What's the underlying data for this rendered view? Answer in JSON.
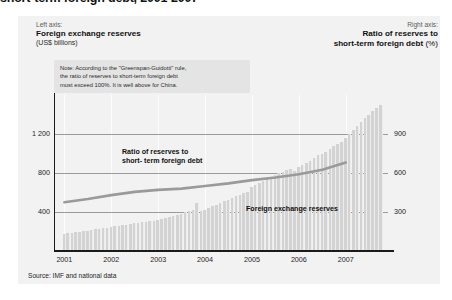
{
  "figure": {
    "title_cropped": "short-term foreign debt, 2001-2007",
    "credit": "...es Ph./ CERI et Atelier de cartographie, march 2008",
    "source": "Source: IMF and national data"
  },
  "axis_captions": {
    "left": {
      "kicker": "Left axis:",
      "main": "Foreign exchange reserves",
      "sub": "(US$ billions)"
    },
    "right": {
      "kicker": "Right axis:",
      "main": "Ratio of reserves to",
      "main2": "short-term foreign debt",
      "unit": "(%)"
    }
  },
  "note": {
    "line1": "Note: According to the \"Greenspan-Guidotti\" rule,",
    "line2": "the ratio of reserves to short-term foreign debt",
    "line3": "must exceed 100%. It is well above for China."
  },
  "series_labels": {
    "ratio_line1": "Ratio of reserves to",
    "ratio_line2": "short- term foreign debt",
    "bars": "Foreign exchange reserves"
  },
  "colors": {
    "panel": "#f2f2f2",
    "note_box": "#e4e4e4",
    "bar": "#d3d3d3",
    "line": "#9a9a9a",
    "grid": "#7e7e7e",
    "axis": "#1b1b1b",
    "text": "#1a1a1a"
  },
  "chart_data": {
    "type": "bar",
    "title": "short-term foreign debt, 2001-2007",
    "xlabel": "",
    "ylabel": "Foreign exchange reserves (US$ billions)",
    "y2label": "Ratio of reserves to short-term foreign debt (%)",
    "ylim": [
      0,
      1600
    ],
    "y2lim": [
      0,
      1200
    ],
    "yticks": [
      400,
      800,
      1200
    ],
    "ytick_labels": [
      "400",
      "800",
      "1 200"
    ],
    "y2ticks": [
      300,
      600,
      900
    ],
    "y2tick_labels": [
      "300",
      "600",
      "900"
    ],
    "xlim": [
      2000.8,
      2007.9
    ],
    "xticks": [
      2001,
      2002,
      2003,
      2004,
      2005,
      2006,
      2007
    ],
    "xtick_labels": [
      "2001",
      "2002",
      "2003",
      "2004",
      "2005",
      "2006",
      "2007"
    ],
    "grid": true,
    "legend": "in-plot labels",
    "series": [
      {
        "name": "Foreign exchange reserves",
        "type": "bar",
        "axis": "left",
        "unit": "US$ billions",
        "x": [
          2001.0,
          2001.08,
          2001.17,
          2001.25,
          2001.33,
          2001.42,
          2001.5,
          2001.58,
          2001.67,
          2001.75,
          2001.83,
          2001.92,
          2002.0,
          2002.08,
          2002.17,
          2002.25,
          2002.33,
          2002.42,
          2002.5,
          2002.58,
          2002.67,
          2002.75,
          2002.83,
          2002.92,
          2003.0,
          2003.08,
          2003.17,
          2003.25,
          2003.33,
          2003.42,
          2003.5,
          2003.58,
          2003.67,
          2003.75,
          2003.83,
          2003.92,
          2004.0,
          2004.08,
          2004.17,
          2004.25,
          2004.33,
          2004.42,
          2004.5,
          2004.58,
          2004.67,
          2004.75,
          2004.83,
          2004.92,
          2005.0,
          2005.08,
          2005.17,
          2005.25,
          2005.33,
          2005.42,
          2005.5,
          2005.58,
          2005.67,
          2005.75,
          2005.83,
          2005.92,
          2006.0,
          2006.08,
          2006.17,
          2006.25,
          2006.33,
          2006.42,
          2006.5,
          2006.58,
          2006.67,
          2006.75,
          2006.83,
          2006.92,
          2007.0,
          2007.08,
          2007.17,
          2007.25,
          2007.33,
          2007.42,
          2007.5,
          2007.58,
          2007.67,
          2007.75
        ],
        "values": [
          175,
          180,
          186,
          192,
          198,
          204,
          210,
          216,
          222,
          228,
          234,
          240,
          246,
          252,
          258,
          264,
          270,
          278,
          284,
          290,
          296,
          300,
          306,
          312,
          320,
          330,
          340,
          350,
          360,
          372,
          384,
          396,
          406,
          416,
          496,
          408,
          420,
          440,
          458,
          470,
          490,
          510,
          528,
          545,
          560,
          575,
          590,
          610,
          660,
          680,
          700,
          720,
          740,
          760,
          780,
          800,
          815,
          830,
          845,
          820,
          860,
          880,
          900,
          925,
          950,
          980,
          1000,
          1020,
          1050,
          1080,
          1100,
          1120,
          1160,
          1200,
          1240,
          1280,
          1320,
          1360,
          1400,
          1440,
          1470,
          1500
        ]
      },
      {
        "name": "Ratio of reserves to short-term foreign debt",
        "type": "line",
        "axis": "right",
        "unit": "%",
        "x": [
          2001.0,
          2001.5,
          2002.0,
          2002.5,
          2003.0,
          2003.5,
          2004.0,
          2004.5,
          2005.0,
          2005.5,
          2006.0,
          2006.5,
          2007.0
        ],
        "values": [
          375,
          400,
          430,
          455,
          470,
          480,
          500,
          520,
          545,
          565,
          590,
          625,
          680
        ]
      }
    ]
  }
}
